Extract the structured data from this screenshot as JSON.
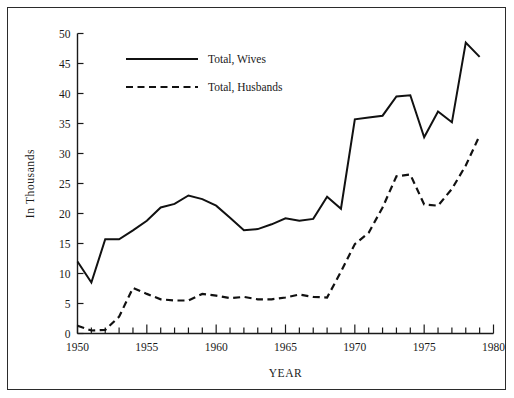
{
  "figure": {
    "has_border_frame": true,
    "background_color": "#ffffff",
    "line_color": "#111111"
  },
  "chart_data": {
    "type": "line",
    "title": "",
    "subtitle": "",
    "xlabel": "YEAR",
    "ylabel": "In Thousands",
    "xlim": [
      1950,
      1980
    ],
    "ylim": [
      0,
      50
    ],
    "grid": false,
    "legend_position": "upper-left-inside",
    "x_tick_labels": [
      "1950",
      "1955",
      "1960",
      "1965",
      "1970",
      "1975",
      "1980"
    ],
    "x_major_ticks": [
      1950,
      1955,
      1960,
      1965,
      1970,
      1975,
      1980
    ],
    "x_minor_tick_step": 1,
    "y_tick_labels": [
      "0",
      "5",
      "10",
      "15",
      "20",
      "25",
      "30",
      "35",
      "40",
      "45",
      "50"
    ],
    "y_major_ticks": [
      0,
      5,
      10,
      15,
      20,
      25,
      30,
      35,
      40,
      45,
      50
    ],
    "x": [
      1950,
      1951,
      1952,
      1953,
      1954,
      1955,
      1956,
      1957,
      1958,
      1959,
      1960,
      1961,
      1962,
      1963,
      1964,
      1965,
      1966,
      1967,
      1968,
      1969,
      1970,
      1971,
      1972,
      1973,
      1974,
      1975,
      1976,
      1977,
      1978,
      1979
    ],
    "series": [
      {
        "name": "Total, Wives",
        "style": "solid",
        "color": "#111111",
        "values": [
          12.0,
          8.5,
          15.7,
          15.7,
          17.2,
          18.8,
          21.0,
          21.6,
          23.0,
          22.4,
          21.3,
          19.3,
          17.2,
          17.4,
          18.2,
          19.2,
          18.8,
          19.1,
          22.8,
          20.8,
          35.7,
          36.0,
          36.3,
          39.5,
          39.7,
          32.7,
          37.0,
          35.2,
          48.5,
          46.1
        ]
      },
      {
        "name": "Total, Husbands",
        "style": "dashed",
        "color": "#111111",
        "values": [
          1.3,
          0.5,
          0.6,
          2.8,
          7.6,
          6.6,
          5.7,
          5.5,
          5.5,
          6.6,
          6.3,
          5.9,
          6.1,
          5.7,
          5.7,
          6.0,
          6.5,
          6.1,
          6.0,
          10.3,
          14.9,
          16.8,
          21.0,
          26.2,
          26.5,
          21.5,
          21.3,
          24.1,
          28.0,
          33.0
        ]
      }
    ],
    "legend": [
      {
        "label": "Total, Wives",
        "style": "solid"
      },
      {
        "label": "Total, Husbands",
        "style": "dashed"
      }
    ]
  }
}
